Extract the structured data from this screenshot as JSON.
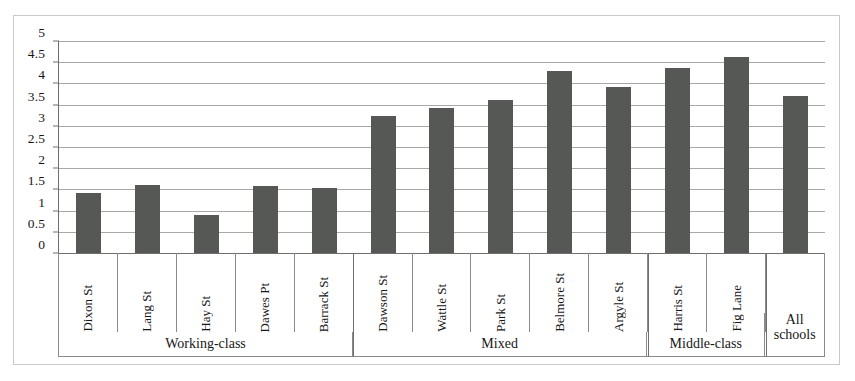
{
  "chart_data": {
    "type": "bar",
    "title": "",
    "subtitle": "",
    "xlabel": "",
    "ylabel": "",
    "ylim": [
      0,
      5
    ],
    "ytick_labels": [
      "5",
      "4.5",
      "4",
      "3.5",
      "3",
      "2.5",
      "2",
      "1.5",
      "1",
      "0.5",
      "0"
    ],
    "ytick_values": [
      5,
      4.5,
      4,
      3.5,
      3,
      2.5,
      2,
      1.5,
      1,
      0.5,
      0
    ],
    "grid": true,
    "legend": "none",
    "bar_color": "#565856",
    "gridline_color": "#a8a8a8",
    "axis_color": "#6e6e6e",
    "categories": [
      "Dixon St",
      "Lang St",
      "Hay St",
      "Dawes Pt",
      "Barrack St",
      "Dawson St",
      "Wattle St",
      "Park St",
      "Belmore St",
      "Argyle St",
      "Harris St",
      "Fig Lane",
      "All schools"
    ],
    "values": [
      1.41,
      1.6,
      0.89,
      1.59,
      1.53,
      3.23,
      3.43,
      3.62,
      4.3,
      3.92,
      4.37,
      4.62,
      3.7
    ],
    "groups": [
      {
        "label": "Working-class",
        "count": 5,
        "rotated_labels": true
      },
      {
        "label": "Mixed",
        "count": 5,
        "rotated_labels": true
      },
      {
        "label": "Middle-class",
        "count": 2,
        "rotated_labels": true
      },
      {
        "label": "All\nschools",
        "count": 1,
        "rotated_labels": false,
        "line1": "All",
        "line2": "schools"
      }
    ]
  }
}
